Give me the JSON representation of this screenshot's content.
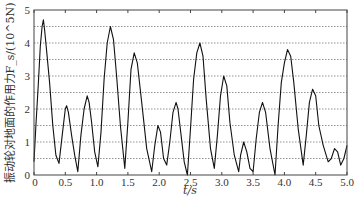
{
  "chart_data": {
    "type": "line",
    "title": "",
    "xlabel": "t/s",
    "ylabel": "振动轮对地面的作用力F_s/(10^5N)",
    "xlim": [
      0,
      5.0
    ],
    "ylim": [
      0,
      5
    ],
    "xticks": [
      "0",
      "0.5",
      "1.0",
      "1.5",
      "2.0",
      "2.5",
      "3.0",
      "3.5",
      "4.0",
      "4.5",
      "5.0"
    ],
    "yticks": [
      "0",
      "1",
      "2",
      "3",
      "4",
      "5"
    ],
    "grid": "horizontal dotted lines every 0.5",
    "legend": null,
    "series": [
      {
        "name": "F_s",
        "x": [
          0.0,
          0.03,
          0.07,
          0.1,
          0.13,
          0.15,
          0.17,
          0.2,
          0.25,
          0.3,
          0.35,
          0.4,
          0.45,
          0.5,
          0.52,
          0.55,
          0.6,
          0.65,
          0.7,
          0.75,
          0.8,
          0.85,
          0.88,
          0.92,
          0.97,
          1.02,
          1.07,
          1.12,
          1.17,
          1.22,
          1.27,
          1.32,
          1.38,
          1.45,
          1.5,
          1.55,
          1.6,
          1.65,
          1.72,
          1.8,
          1.88,
          1.93,
          1.98,
          2.02,
          2.07,
          2.12,
          2.17,
          2.22,
          2.27,
          2.3,
          2.35,
          2.4,
          2.45,
          2.5,
          2.55,
          2.6,
          2.65,
          2.7,
          2.75,
          2.82,
          2.88,
          2.93,
          2.98,
          3.03,
          3.08,
          3.13,
          3.2,
          3.27,
          3.3,
          3.35,
          3.4,
          3.45,
          3.5,
          3.55,
          3.6,
          3.65,
          3.7,
          3.77,
          3.85,
          3.9,
          3.95,
          4.0,
          4.05,
          4.1,
          4.15,
          4.22,
          4.3,
          4.35,
          4.4,
          4.45,
          4.5,
          4.55,
          4.62,
          4.7,
          4.75,
          4.8,
          4.85,
          4.9,
          4.95,
          5.0
        ],
        "values": [
          0.4,
          1.5,
          2.8,
          3.9,
          4.5,
          4.7,
          4.4,
          3.8,
          2.8,
          1.5,
          0.6,
          0.35,
          1.2,
          2.0,
          2.1,
          1.9,
          1.2,
          0.6,
          0.1,
          1.2,
          2.0,
          2.4,
          2.2,
          1.6,
          0.7,
          0.25,
          1.3,
          2.9,
          4.0,
          4.5,
          4.1,
          3.0,
          1.5,
          0.2,
          1.6,
          3.2,
          3.7,
          3.4,
          2.2,
          0.8,
          0.1,
          0.9,
          1.5,
          1.3,
          0.5,
          0.3,
          1.0,
          1.9,
          2.2,
          2.0,
          1.2,
          0.4,
          0.0,
          1.4,
          2.9,
          3.7,
          4.0,
          3.6,
          2.3,
          0.8,
          0.2,
          1.2,
          2.4,
          3.0,
          2.7,
          1.6,
          0.6,
          0.1,
          0.6,
          1.0,
          0.7,
          0.2,
          0.1,
          1.1,
          1.9,
          2.2,
          1.9,
          0.8,
          0.0,
          1.5,
          2.8,
          3.4,
          3.8,
          3.6,
          2.8,
          1.4,
          0.3,
          1.2,
          2.2,
          2.6,
          2.4,
          1.5,
          0.9,
          0.4,
          0.5,
          0.8,
          0.7,
          0.3,
          0.5,
          0.9
        ]
      }
    ]
  }
}
